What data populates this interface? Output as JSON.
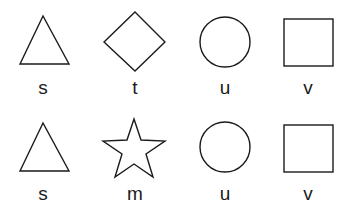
{
  "rows": [
    {
      "items": [
        {
          "shape": "triangle",
          "label": "s"
        },
        {
          "shape": "diamond",
          "label": "t"
        },
        {
          "shape": "circle",
          "label": "u"
        },
        {
          "shape": "square",
          "label": "v"
        }
      ]
    },
    {
      "items": [
        {
          "shape": "triangle",
          "label": "s"
        },
        {
          "shape": "star",
          "label": "m"
        },
        {
          "shape": "circle",
          "label": "u"
        },
        {
          "shape": "square",
          "label": "v"
        }
      ]
    }
  ]
}
